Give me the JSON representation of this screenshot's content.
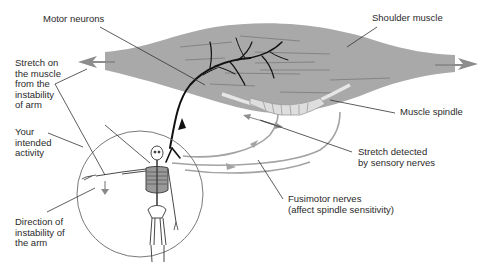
{
  "labels": {
    "motor_neurons": "Motor neurons",
    "shoulder_muscle": "Shoulder muscle",
    "stretch_on_muscle": "Stretch on\nthe muscle\nfrom the\ninstability\nof arm",
    "muscle_spindle": "Muscle spindle",
    "your_intended_activity": "Your\nintended\nactivity",
    "stretch_detected": "Stretch detected\nby sensory nerves",
    "fusimotor_nerves": "Fusimotor nerves\n(affect spindle sensitivity)",
    "direction_of_instability": "Direction of\ninstability of\nthe arm"
  },
  "colors": {
    "muscle_fill": "#a9a9a9",
    "muscle_fibers": "#7e7e7e",
    "motor_neuron": "#111111",
    "sensory_nerve": "#9a9a9a",
    "leader_line": "#333333",
    "circle_outline": "#666666"
  }
}
